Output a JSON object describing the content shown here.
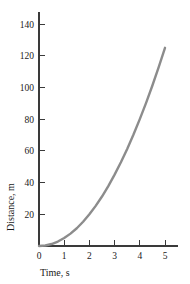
{
  "chart_data": {
    "type": "line",
    "title": "",
    "subtitle": "",
    "xlabel": "Time, s",
    "ylabel": "Distance, m",
    "xlim": [
      0,
      5.5
    ],
    "ylim": [
      0,
      147
    ],
    "grid": false,
    "legend": null,
    "x_ticks": [
      "0",
      "1",
      "2",
      "3",
      "4",
      "5"
    ],
    "x_tick_values": [
      0,
      1,
      2,
      3,
      4,
      5
    ],
    "y_ticks": [
      "20",
      "40",
      "60",
      "80",
      "100",
      "120",
      "140"
    ],
    "y_tick_values": [
      20,
      40,
      60,
      80,
      100,
      120,
      140
    ],
    "series": [
      {
        "name": "distance",
        "color": "#8c8c8c",
        "x": [
          0,
          0.25,
          0.5,
          0.75,
          1,
          1.25,
          1.5,
          1.75,
          2,
          2.25,
          2.5,
          2.75,
          3,
          3.25,
          3.5,
          3.75,
          4,
          4.25,
          4.5,
          4.75,
          5
        ],
        "y": [
          0,
          0.3,
          1.25,
          2.8,
          5,
          7.8,
          11.2,
          15.3,
          20,
          25.3,
          31.2,
          37.8,
          45,
          52.8,
          61.2,
          70.3,
          80,
          90.3,
          101.2,
          112.8,
          125
        ]
      }
    ]
  },
  "style": {
    "curve_color": "#8c8c8c",
    "axis_color": "#3a3a3a",
    "text_color": "#1a1a1a",
    "background": "#ffffff"
  }
}
